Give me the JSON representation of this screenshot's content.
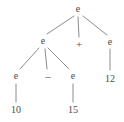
{
  "figure": {
    "kind": "parse-tree",
    "background_color": "#ffffff",
    "stroke_color": "#8c8c8c",
    "text_color": "#4a4a4a",
    "width": 124,
    "height": 122,
    "expression": "10 - 15 + 12"
  },
  "nodes": [
    {
      "id": "n0",
      "label": "e",
      "role": "nonterminal",
      "x": 78,
      "y": 9,
      "depth": 0
    },
    {
      "id": "n1",
      "label": "e",
      "role": "nonterminal",
      "x": 43,
      "y": 41,
      "depth": 1
    },
    {
      "id": "n2",
      "label": "+",
      "role": "operator",
      "x": 79,
      "y": 44,
      "depth": 1
    },
    {
      "id": "n3",
      "label": "e",
      "role": "nonterminal",
      "x": 110,
      "y": 42,
      "depth": 1
    },
    {
      "id": "n4",
      "label": "e",
      "role": "nonterminal",
      "x": 16,
      "y": 76,
      "depth": 2
    },
    {
      "id": "n5",
      "label": "–",
      "role": "operator",
      "x": 48,
      "y": 76,
      "depth": 2
    },
    {
      "id": "n6",
      "label": "e",
      "role": "nonterminal",
      "x": 73,
      "y": 76,
      "depth": 2
    },
    {
      "id": "n7",
      "label": "12",
      "role": "terminal",
      "x": 110,
      "y": 79,
      "depth": 2
    },
    {
      "id": "n8",
      "label": "10",
      "role": "terminal",
      "x": 16,
      "y": 110,
      "depth": 3
    },
    {
      "id": "n9",
      "label": "15",
      "role": "terminal",
      "x": 73,
      "y": 110,
      "depth": 3
    }
  ],
  "edges": [
    {
      "from": "n0",
      "to": "n1",
      "x1": 74,
      "y1": 16,
      "x2": 47,
      "y2": 34
    },
    {
      "from": "n0",
      "to": "n2",
      "x1": 78,
      "y1": 17,
      "x2": 79,
      "y2": 37
    },
    {
      "from": "n0",
      "to": "n3",
      "x1": 83,
      "y1": 16,
      "x2": 107,
      "y2": 35
    },
    {
      "from": "n1",
      "to": "n4",
      "x1": 39,
      "y1": 48,
      "x2": 20,
      "y2": 69
    },
    {
      "from": "n1",
      "to": "n5",
      "x1": 45,
      "y1": 49,
      "x2": 47,
      "y2": 69
    },
    {
      "from": "n1",
      "to": "n6",
      "x1": 48,
      "y1": 48,
      "x2": 69,
      "y2": 69
    },
    {
      "from": "n3",
      "to": "n7",
      "x1": 110,
      "y1": 49,
      "x2": 110,
      "y2": 70
    },
    {
      "from": "n4",
      "to": "n8",
      "x1": 16,
      "y1": 84,
      "x2": 16,
      "y2": 102
    },
    {
      "from": "n6",
      "to": "n9",
      "x1": 73,
      "y1": 84,
      "x2": 73,
      "y2": 102
    }
  ]
}
